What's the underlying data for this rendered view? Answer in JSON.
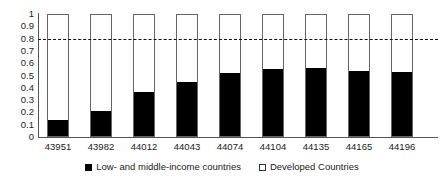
{
  "chart_data": {
    "type": "bar",
    "stacked": true,
    "normalized": true,
    "title": "",
    "subtitle": "",
    "xlabel": "",
    "ylabel": "",
    "ylim": [
      0,
      1
    ],
    "ytick_labels": [
      "1",
      "0.9",
      "0.8",
      "0.7",
      "0.6",
      "0.5",
      "0.4",
      "0.3",
      "0.2",
      "0.1",
      "0"
    ],
    "ytick_values": [
      1,
      0.9,
      0.8,
      0.7,
      0.6,
      0.5,
      0.4,
      0.3,
      0.2,
      0.1,
      0
    ],
    "grid": false,
    "legend_position": "bottom",
    "categories": [
      "43951",
      "43982",
      "44012",
      "44043",
      "44074",
      "44104",
      "44135",
      "44165",
      "44196"
    ],
    "series": [
      {
        "name": "Low- and middle-income countries",
        "color": "#000000",
        "values": [
          0.13,
          0.21,
          0.36,
          0.45,
          0.52,
          0.55,
          0.56,
          0.54,
          0.53
        ]
      },
      {
        "name": "Developed Countries",
        "color": "#ffffff",
        "values": [
          0.87,
          0.79,
          0.64,
          0.55,
          0.48,
          0.45,
          0.44,
          0.46,
          0.47
        ]
      }
    ],
    "annotations": [
      {
        "name": "threshold-line",
        "type": "horizontal-dashed-line",
        "value": 0.8,
        "color": "#111111"
      }
    ]
  },
  "legend": {
    "items": [
      {
        "label": "Low- and middle-income countries",
        "swatch": "filled-square-icon"
      },
      {
        "label": "Developed Countries",
        "swatch": "hollow-square-icon"
      }
    ]
  }
}
